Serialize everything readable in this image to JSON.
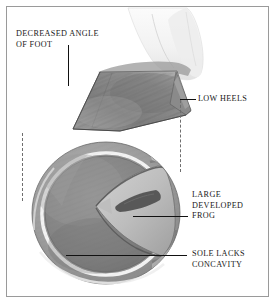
{
  "figure": {
    "title_semantic": "equine-hoof-low-angle-diagram",
    "background_color": "#ffffff",
    "border_color": "#9a9a9a",
    "text_color": "#181818",
    "leader_color": "#111111",
    "dash_color": "#6e6e6e"
  },
  "labels": {
    "decreased_angle": "DECREASED ANGLE\nOF FOOT",
    "low_heels": "LOW HEELS",
    "large_developed_frog": "LARGE\nDEVELOPED\nFROG",
    "sole_lacks_concavity": "SOLE LACKS\nCONCAVITY"
  },
  "illustration": {
    "upper_view": "lateral-hoof-low-angle",
    "lower_view": "solar-surface-hoof",
    "parts": [
      "pastern",
      "hoof-wall",
      "coronary-band",
      "heel",
      "white-line",
      "sole",
      "frog",
      "central-sulcus",
      "bar",
      "collateral-groove"
    ]
  },
  "palette": {
    "wall_dark": "#6e6e6e",
    "wall_mid": "#8c8c8c",
    "wall_light": "#b4b4b4",
    "sole_dark": "#787878",
    "sole_mid": "#8f8f8f",
    "frog_light": "#c9c9c9",
    "highlight": "#f2f2f2",
    "pastern": "#f4f4f4"
  }
}
